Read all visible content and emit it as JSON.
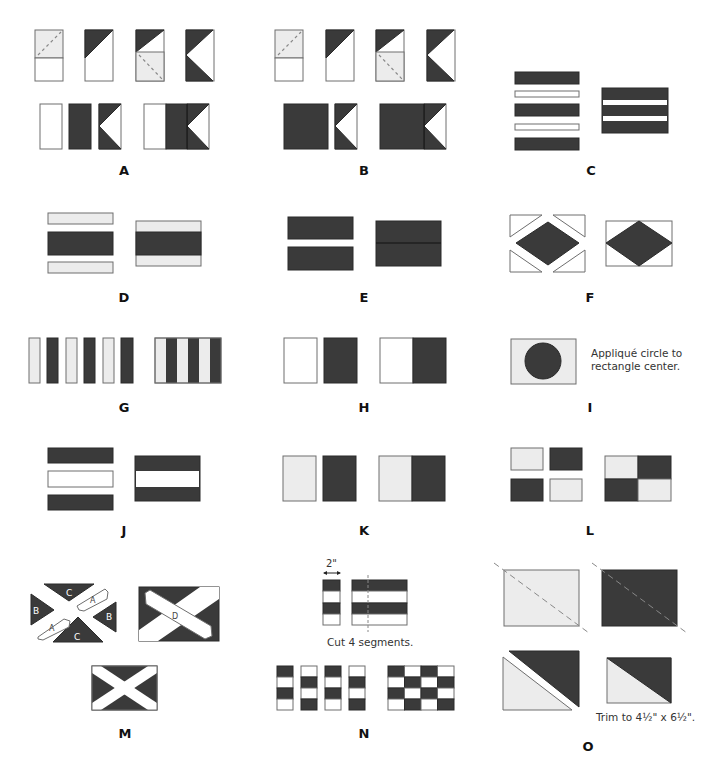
{
  "colors": {
    "dark": "#3a3a3a",
    "light": "#ececec",
    "white": "#ffffff",
    "outline": "#6e6e6e",
    "dash": "#888888"
  },
  "panels": [
    {
      "id": "A",
      "label": "A"
    },
    {
      "id": "B",
      "label": "B"
    },
    {
      "id": "C",
      "label": "C"
    },
    {
      "id": "D",
      "label": "D"
    },
    {
      "id": "E",
      "label": "E"
    },
    {
      "id": "F",
      "label": "F"
    },
    {
      "id": "G",
      "label": "G"
    },
    {
      "id": "H",
      "label": "H"
    },
    {
      "id": "I",
      "label": "I",
      "note_line1": "Appliqué circle to",
      "note_line2": "rectangle center."
    },
    {
      "id": "J",
      "label": "J"
    },
    {
      "id": "K",
      "label": "K"
    },
    {
      "id": "L",
      "label": "L"
    },
    {
      "id": "M",
      "label": "M",
      "piece_labels": {
        "a": "A",
        "b": "B",
        "c": "C",
        "d": "D"
      }
    },
    {
      "id": "N",
      "label": "N",
      "dimension": "2\"",
      "note": "Cut 4 segments."
    },
    {
      "id": "O",
      "label": "O",
      "note": "Trim to 4½\" x 6½\"."
    }
  ]
}
